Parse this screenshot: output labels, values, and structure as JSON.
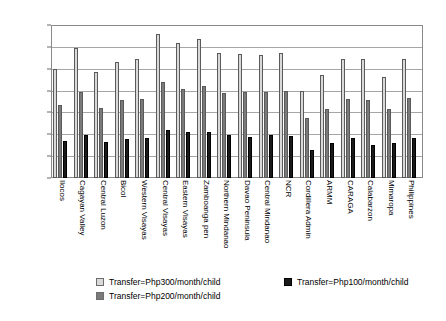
{
  "chart_data": {
    "type": "bar",
    "title": "",
    "xlabel": "",
    "ylabel": "",
    "ylim": [
      0,
      35
    ],
    "ytick_labels": [
      "0.00%",
      "5.00%",
      "10.00%",
      "15.00%",
      "20.00%",
      "25.00%",
      "30.00%",
      "35.00%"
    ],
    "ytick_values": [
      0,
      5,
      10,
      15,
      20,
      25,
      30,
      35
    ],
    "grid": true,
    "legend_position": "bottom",
    "categories": [
      "Ilocos",
      "Cagayan Valley",
      "Central Luzon",
      "Bicol",
      "Western Visayas",
      "Central Visayas",
      "Eastern Visayas",
      "Zamboanga pen",
      "Northern Mindanao",
      "Davao Peninsula",
      "Central Mindanao",
      "NCR",
      "Cordillera Admin",
      "ARMM",
      "CARAGA",
      "Calabarzon",
      "Mimaropa",
      "Philippines"
    ],
    "series": [
      {
        "name": "Transfer=Php300/month/child",
        "color": "#d9d9d9",
        "values": [
          25.2,
          29.9,
          24.3,
          26.8,
          27.4,
          33.1,
          31.2,
          32.1,
          28.8,
          28.6,
          28.3,
          28.7,
          20.0,
          23.8,
          27.3,
          27.3,
          23.2,
          27.4
        ]
      },
      {
        "name": "Transfer=Php200/month/child",
        "color": "#7a7a7a",
        "values": [
          16.9,
          19.8,
          16.1,
          17.9,
          18.2,
          22.1,
          20.6,
          21.2,
          19.6,
          19.8,
          19.9,
          20.0,
          13.8,
          16.0,
          18.2,
          18.0,
          15.8,
          18.4
        ]
      },
      {
        "name": "Transfer=Php100/month/child",
        "color": "#1a1a1a",
        "values": [
          8.6,
          9.9,
          8.2,
          9.0,
          9.3,
          11.1,
          10.5,
          10.7,
          9.8,
          9.4,
          9.9,
          9.6,
          6.5,
          8.1,
          9.2,
          7.6,
          8.0,
          9.3
        ]
      }
    ],
    "legend_entries": [
      "Transfer=Php300/month/child",
      "Transfer=Php100/month/child",
      "Transfer=Php200/month/child"
    ]
  }
}
